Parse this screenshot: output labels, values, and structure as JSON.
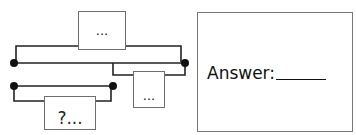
{
  "diagram": {
    "top_box_label": "...",
    "right_box_label": "...",
    "question_box_label": "?...",
    "answer_label": "Answer:",
    "answer_value": ""
  },
  "colors": {
    "line": "#222222",
    "dot": "#111111",
    "box_border": "#6e6e6e"
  }
}
